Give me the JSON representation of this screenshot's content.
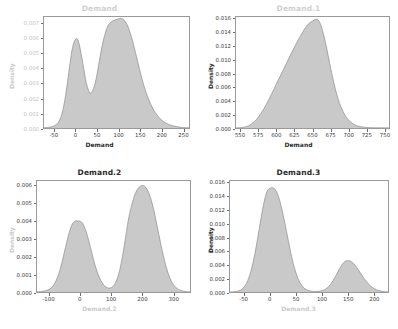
{
  "figure": {
    "background_color": "#ffffff",
    "curve_fill_color": "#c9c9c9",
    "curve_line_color": "#8a8a8a",
    "axis_color": "#9a9a9a",
    "layout": "2x2 grid of kernel density plots"
  },
  "chart_data": [
    {
      "type": "area",
      "panel": "top-left",
      "title": "Demand",
      "xlabel": "Demand",
      "ylabel": "Density",
      "xlim": [
        -75,
        265
      ],
      "ylim": [
        0,
        0.00745
      ],
      "xticks": [
        -50,
        0,
        50,
        100,
        150,
        200,
        250
      ],
      "xtick_labels": [
        "-50",
        "0",
        "50",
        "100",
        "150",
        "200",
        "250"
      ],
      "yticks": [
        0.0,
        0.001,
        0.002,
        0.003,
        0.004,
        0.005,
        0.006,
        0.007
      ],
      "ytick_labels": [
        "0.000",
        "0.001",
        "0.002",
        "0.003",
        "0.004",
        "0.005",
        "0.006",
        "0.007"
      ],
      "grid": false,
      "legend": null,
      "description": "Bimodal kernel density: small mode near 0 (peak ~0.0060) and larger mode near 105 (peak ~0.0073), trough near 33 (~0.00235)",
      "modes": [
        {
          "location": 2,
          "peak_density": 0.006
        },
        {
          "location": 105,
          "peak_density": 0.00735
        }
      ],
      "x": [
        -75,
        -65,
        -55,
        -45,
        -38,
        -32,
        -26,
        -20,
        -14,
        -8,
        -2,
        2,
        6,
        12,
        18,
        24,
        30,
        33,
        38,
        44,
        50,
        56,
        62,
        68,
        74,
        80,
        86,
        92,
        98,
        104,
        110,
        116,
        122,
        128,
        134,
        140,
        146,
        152,
        158,
        166,
        174,
        182,
        190,
        200,
        212,
        226,
        240,
        252,
        265
      ],
      "values": [
        2e-05,
        4e-05,
        0.0001,
        0.00026,
        0.00055,
        0.00105,
        0.0019,
        0.00305,
        0.00435,
        0.0054,
        0.00592,
        0.006,
        0.0058,
        0.005,
        0.004,
        0.00305,
        0.00248,
        0.00235,
        0.00245,
        0.0029,
        0.0037,
        0.0047,
        0.0056,
        0.0063,
        0.0068,
        0.00706,
        0.00718,
        0.00726,
        0.00731,
        0.00735,
        0.0073,
        0.00713,
        0.0068,
        0.0063,
        0.0057,
        0.005,
        0.0043,
        0.0036,
        0.00295,
        0.00225,
        0.00168,
        0.00122,
        0.00088,
        0.00055,
        0.00031,
        0.00016,
        7e-05,
        3e-05,
        1e-05
      ]
    },
    {
      "type": "area",
      "panel": "top-right",
      "title": "Demand.1",
      "xlabel": "Demand",
      "ylabel": "Density",
      "xlim": [
        543,
        757
      ],
      "ylim": [
        0,
        0.0163
      ],
      "xticks": [
        550,
        575,
        600,
        625,
        650,
        675,
        700,
        725,
        750
      ],
      "xtick_labels": [
        "550",
        "575",
        "600",
        "625",
        "650",
        "675",
        "700",
        "725",
        "750"
      ],
      "yticks": [
        0.0,
        0.002,
        0.004,
        0.006,
        0.008,
        0.01,
        0.012,
        0.014,
        0.016
      ],
      "ytick_labels": [
        "0.000",
        "0.002",
        "0.004",
        "0.006",
        "0.008",
        "0.010",
        "0.012",
        "0.014",
        "0.016"
      ],
      "grid": false,
      "legend": null,
      "description": "Unimodal right-skewed-left kernel density peaking near 655 at about 0.0160",
      "modes": [
        {
          "location": 655,
          "peak_density": 0.016
        }
      ],
      "x": [
        543,
        552,
        560,
        566,
        572,
        578,
        584,
        590,
        596,
        602,
        608,
        614,
        620,
        626,
        632,
        638,
        642,
        646,
        650,
        654,
        658,
        662,
        666,
        670,
        674,
        678,
        682,
        686,
        690,
        696,
        702,
        710,
        718,
        726,
        734,
        744,
        757
      ],
      "values": [
        2e-05,
        8e-05,
        0.0003,
        0.0007,
        0.0013,
        0.00215,
        0.0032,
        0.0044,
        0.0057,
        0.007,
        0.0083,
        0.0096,
        0.0109,
        0.01215,
        0.0133,
        0.0144,
        0.015,
        0.01545,
        0.0157,
        0.01595,
        0.01585,
        0.015,
        0.0135,
        0.0116,
        0.0095,
        0.0075,
        0.0057,
        0.0042,
        0.00305,
        0.0018,
        0.001,
        0.00042,
        0.00018,
        8e-05,
        4e-05,
        2e-05,
        1e-05
      ]
    },
    {
      "type": "area",
      "panel": "bottom-left",
      "title": "Demand.2",
      "xlabel": "Demand.2",
      "ylabel": "Density",
      "xlim": [
        -140,
        355
      ],
      "ylim": [
        0,
        0.00625
      ],
      "xticks": [
        -100,
        0,
        100,
        200,
        300
      ],
      "xtick_labels": [
        "-100",
        "0",
        "100",
        "200",
        "300"
      ],
      "yticks": [
        0.0,
        0.001,
        0.002,
        0.003,
        0.004,
        0.005,
        0.006
      ],
      "ytick_labels": [
        "0.000",
        "0.001",
        "0.002",
        "0.003",
        "0.004",
        "0.005",
        "0.006"
      ],
      "grid": false,
      "legend": null,
      "description": "Strongly bimodal kernel density: smaller mode near 0 (peak ~0.0040) and dominant mode near 200 (peak ~0.0060), deep trough near 95 (~0.00022)",
      "modes": [
        {
          "location": 0,
          "peak_density": 0.004
        },
        {
          "location": 202,
          "peak_density": 0.006
        }
      ],
      "x": [
        -140,
        -125,
        -110,
        -98,
        -88,
        -78,
        -68,
        -58,
        -48,
        -38,
        -28,
        -18,
        -8,
        0,
        8,
        18,
        28,
        38,
        48,
        58,
        68,
        78,
        88,
        95,
        105,
        115,
        125,
        135,
        145,
        155,
        165,
        175,
        185,
        195,
        202,
        210,
        220,
        230,
        240,
        250,
        260,
        270,
        282,
        295,
        310,
        325,
        340,
        355
      ],
      "values": [
        1e-05,
        3e-05,
        8e-05,
        0.00018,
        0.00035,
        0.00065,
        0.0011,
        0.00175,
        0.0025,
        0.0032,
        0.00375,
        0.00398,
        0.004,
        0.00398,
        0.00385,
        0.00345,
        0.00285,
        0.00215,
        0.0015,
        0.00098,
        0.0006,
        0.00035,
        0.00024,
        0.00022,
        0.0003,
        0.00055,
        0.00105,
        0.00185,
        0.0029,
        0.004,
        0.0048,
        0.0054,
        0.00578,
        0.00596,
        0.006,
        0.00592,
        0.00565,
        0.00515,
        0.00445,
        0.0036,
        0.00275,
        0.00195,
        0.00118,
        0.0006,
        0.00024,
        9e-05,
        3e-05,
        1e-05
      ]
    },
    {
      "type": "area",
      "panel": "bottom-right",
      "title": "Demand.3",
      "xlabel": "Demand.3",
      "ylabel": "Density",
      "xlim": [
        -78,
        228
      ],
      "ylim": [
        0,
        0.0163
      ],
      "xticks": [
        -50,
        0,
        50,
        100,
        150,
        200
      ],
      "xtick_labels": [
        "-50",
        "0",
        "50",
        "100",
        "150",
        "200"
      ],
      "yticks": [
        0.0,
        0.002,
        0.004,
        0.006,
        0.008,
        0.01,
        0.012,
        0.014,
        0.016
      ],
      "ytick_labels": [
        "0.000",
        "0.002",
        "0.004",
        "0.006",
        "0.008",
        "0.010",
        "0.012",
        "0.014",
        "0.016"
      ],
      "grid": false,
      "legend": null,
      "description": "Bimodal kernel density: tall narrow mode near 5 (peak ~0.0153) and small mode near 150 (peak ~0.0046), near-zero between 70 and 105",
      "modes": [
        {
          "location": 5,
          "peak_density": 0.0153
        },
        {
          "location": 150,
          "peak_density": 0.0046
        }
      ],
      "x": [
        -78,
        -70,
        -62,
        -55,
        -48,
        -42,
        -36,
        -30,
        -24,
        -18,
        -12,
        -6,
        0,
        5,
        10,
        16,
        22,
        28,
        34,
        40,
        46,
        52,
        58,
        64,
        70,
        78,
        86,
        94,
        102,
        110,
        118,
        126,
        134,
        142,
        150,
        158,
        166,
        174,
        182,
        190,
        198,
        206,
        214,
        222,
        228
      ],
      "values": [
        1e-05,
        4e-05,
        0.00014,
        0.0004,
        0.001,
        0.002,
        0.0035,
        0.00555,
        0.0081,
        0.0108,
        0.0132,
        0.0148,
        0.01525,
        0.0153,
        0.015,
        0.014,
        0.0123,
        0.0102,
        0.0079,
        0.00565,
        0.00375,
        0.0023,
        0.0013,
        0.00068,
        0.00034,
        0.00014,
        8e-05,
        0.0001,
        0.00022,
        0.00058,
        0.00125,
        0.00225,
        0.0034,
        0.0043,
        0.00462,
        0.0044,
        0.00375,
        0.00285,
        0.00195,
        0.0012,
        0.00066,
        0.00032,
        0.00013,
        5e-05,
        2e-05
      ]
    }
  ]
}
